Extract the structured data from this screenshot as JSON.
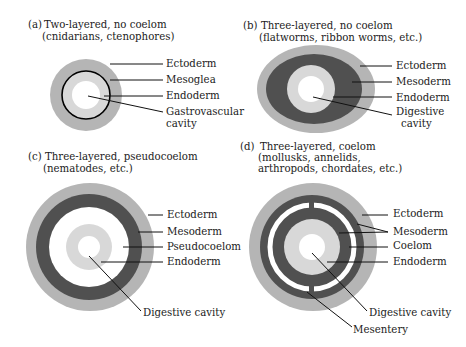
{
  "colors": {
    "ectoderm": "#b5b5b5",
    "mesoderm": "#505050",
    "endoderm": "#d8d8d8",
    "cavity": "#ffffff",
    "mesoglea_ring": "#000000",
    "leader": "#111111",
    "text": "#222222"
  },
  "panels": {
    "a": {
      "letter": "(a)",
      "title_line1": "Two-layered, no coelom",
      "title_line2": "(cnidarians, ctenophores)",
      "labels": [
        "Ectoderm",
        "Mesoglea",
        "Endoderm",
        "Gastrovascular",
        "cavity"
      ]
    },
    "b": {
      "letter": "(b)",
      "title_line1": "Three-layered, no coelom",
      "title_line2": "(flatworms, ribbon worms, etc.)",
      "labels": [
        "Ectoderm",
        "Mesoderm",
        "Endoderm",
        "Digestive",
        "cavity"
      ]
    },
    "c": {
      "letter": "(c)",
      "title_line1": "Three-layered, pseudocoelom",
      "title_line2": "(nematodes, etc.)",
      "labels": [
        "Ectoderm",
        "Mesoderm",
        "Pseudocoelom",
        "Endoderm",
        "Digestive cavity"
      ]
    },
    "d": {
      "letter": "(d)",
      "title_line1": "Three-layered, coelom",
      "title_line2": "(mollusks, annelids,",
      "title_line3": "arthropods, chordates, etc.)",
      "labels": [
        "Ectoderm",
        "Mesoderm",
        "Coelom",
        "Endoderm",
        "Digestive cavity",
        "Mesentery"
      ]
    }
  }
}
